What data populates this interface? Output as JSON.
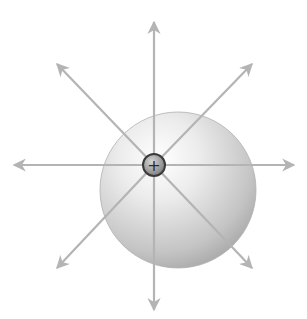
{
  "diagram": {
    "title": "",
    "charge": {
      "sign": "+",
      "cx": 154,
      "cy": 165,
      "r": 11,
      "label": "+"
    },
    "sphere": {
      "cx": 178,
      "cy": 190,
      "r": 78
    },
    "field_lines": [
      {
        "name": "up",
        "x2": 154,
        "y2": 22
      },
      {
        "name": "down",
        "x2": 154,
        "y2": 310
      },
      {
        "name": "left",
        "x2": 14,
        "y2": 165
      },
      {
        "name": "right",
        "x2": 294,
        "y2": 165
      },
      {
        "name": "up-left",
        "x2": 57,
        "y2": 64
      },
      {
        "name": "up-right",
        "x2": 252,
        "y2": 64
      },
      {
        "name": "down-left",
        "x2": 57,
        "y2": 268
      },
      {
        "name": "down-right",
        "x2": 252,
        "y2": 268
      }
    ],
    "colors": {
      "arrow": "#b4b4b4",
      "sphere_light": "#f6f6f6",
      "sphere_dark": "#a8a8a8",
      "charge_fill": "#9a9a9a",
      "charge_stroke": "#3a3a3a"
    }
  }
}
